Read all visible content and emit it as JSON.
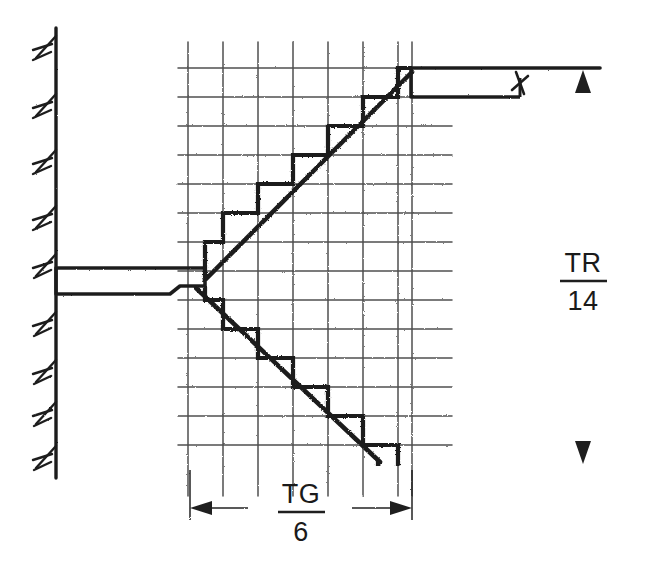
{
  "diagram": {
    "type": "engineering-section-drawing",
    "colors": {
      "ink": "#1f1f1f",
      "grid": "#3a3a3a",
      "background": "#ffffff"
    }
  },
  "labels": {
    "vertical_dimension": {
      "name": "total-rise-label",
      "numerator": "TR",
      "denominator": "14",
      "combined": "TR/14",
      "meaning_hint": "TR over 14"
    },
    "horizontal_dimension": {
      "name": "total-going-label",
      "numerator": "TG",
      "denominator": "6",
      "combined": "TG/6",
      "meaning_hint": "TG over 6"
    }
  },
  "geometry": {
    "grid": {
      "x_start": 188,
      "x_end": 450,
      "y_start": 60,
      "y_end": 466,
      "vertical_line_x": [
        188,
        223,
        258,
        293,
        328,
        363,
        398,
        412
      ],
      "horizontal_line_y": [
        60,
        89,
        118,
        147,
        176,
        205,
        234,
        263,
        292,
        321,
        350,
        379,
        408,
        437,
        466
      ],
      "column_spacing": 35,
      "row_spacing": 29
    },
    "landing_level_y": 278,
    "upper_floor_y": 68,
    "lower_floor_y": 466,
    "wall_x": 56,
    "upper_stair": {
      "riser_count": 7,
      "start": [
        205,
        278
      ],
      "end": [
        413,
        68
      ],
      "direction": "up-right"
    },
    "lower_stair": {
      "riser_count": 7,
      "start": [
        205,
        286
      ],
      "end": [
        378,
        466
      ],
      "direction": "down-right"
    },
    "vertical_dimension_line_x": 583,
    "horizontal_dimension_line_y": 508
  },
  "elements": {
    "wall": "hatched-vertical-wall",
    "upper_slab": "upper-floor-slab",
    "landing_slab": "landing-slab",
    "lower_slab": "lower-floor-line",
    "break_symbol": "break-line-symbol"
  }
}
